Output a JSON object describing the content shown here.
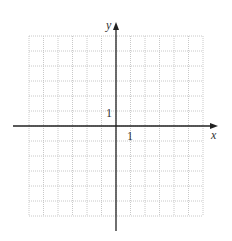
{
  "diagram": {
    "type": "coordinate-grid",
    "grid": {
      "x_min": -6,
      "x_max": 6,
      "y_min": -6,
      "y_max": 6,
      "columns": 12,
      "rows": 12,
      "line_style": "dotted",
      "color": "#c8c8c8"
    },
    "axes": {
      "x_label": "x",
      "y_label": "y",
      "color": "#222222"
    },
    "tick_labels": {
      "x_unit": "1",
      "y_unit": "1"
    }
  }
}
